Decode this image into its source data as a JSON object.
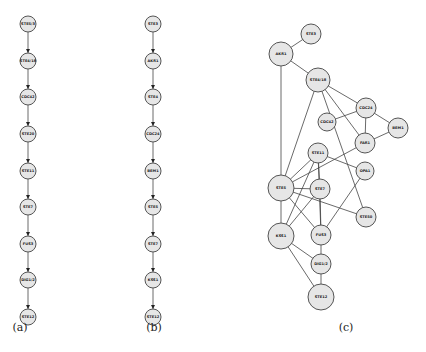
{
  "figure": {
    "panels": [
      {
        "id": "a",
        "caption": "(a)",
        "type": "directed-chain",
        "nodes": [
          "STE5/3",
          "STE4/18",
          "CDC42",
          "STE20",
          "STE11",
          "STE7",
          "FUS3",
          "DIG1/2",
          "STE12"
        ]
      },
      {
        "id": "b",
        "caption": "(b)",
        "type": "directed-chain",
        "nodes": [
          "STE3",
          "AKR1",
          "STE4",
          "CDC24",
          "BEM1",
          "STE5",
          "STE7",
          "KSS1",
          "STE12"
        ]
      },
      {
        "id": "c",
        "caption": "(c)",
        "type": "undirected-network",
        "nodes": [
          "STE3",
          "AKR1",
          "STE4/18",
          "CDC24",
          "CDC42",
          "BEM1",
          "FAR1",
          "STE11",
          "OPA1",
          "STE5",
          "STE7",
          "STE50",
          "KSS1",
          "FUS3",
          "DIG1/2",
          "STE12"
        ],
        "edges": [
          [
            "STE3",
            "AKR1"
          ],
          [
            "AKR1",
            "STE4/18"
          ],
          [
            "AKR1",
            "STE5"
          ],
          [
            "STE4/18",
            "CDC24"
          ],
          [
            "STE4/18",
            "FAR1"
          ],
          [
            "STE4/18",
            "STE5"
          ],
          [
            "STE4/18",
            "STE50"
          ],
          [
            "CDC42",
            "CDC24"
          ],
          [
            "CDC24",
            "FAR1"
          ],
          [
            "CDC24",
            "BEM1"
          ],
          [
            "FAR1",
            "BEM1"
          ],
          [
            "FAR1",
            "STE5"
          ],
          [
            "STE11",
            "STE5"
          ],
          [
            "STE11",
            "STE7"
          ],
          [
            "STE11",
            "OPA1"
          ],
          [
            "STE11",
            "KSS1"
          ],
          [
            "STE11",
            "FUS3"
          ],
          [
            "STE5",
            "STE7"
          ],
          [
            "STE5",
            "STE50"
          ],
          [
            "STE5",
            "KSS1"
          ],
          [
            "STE5",
            "FUS3"
          ],
          [
            "STE7",
            "KSS1"
          ],
          [
            "STE7",
            "FUS3"
          ],
          [
            "OPA1",
            "FUS3"
          ],
          [
            "KSS1",
            "DIG1/2"
          ],
          [
            "KSS1",
            "STE12"
          ],
          [
            "FUS3",
            "DIG1/2"
          ],
          [
            "DIG1/2",
            "STE12"
          ]
        ]
      }
    ]
  }
}
